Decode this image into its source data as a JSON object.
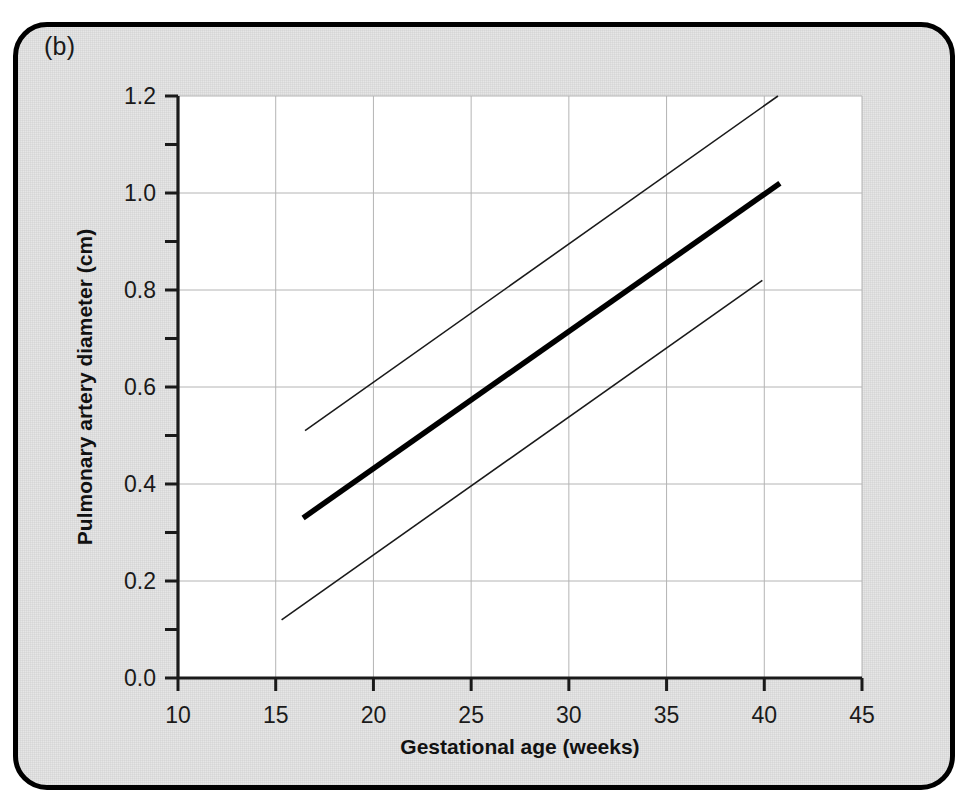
{
  "figure": {
    "panel_label": "(b)",
    "background_color": "#e6e6e6",
    "plot_background_color": "#ffffff",
    "frame_color": "#000000"
  },
  "chart_data": {
    "type": "line",
    "title": "",
    "subtitle": "",
    "xlabel": "Gestational age (weeks)",
    "ylabel": "Pulmonary artery diameter (cm)",
    "xlim": [
      10,
      45
    ],
    "ylim": [
      0.0,
      1.2
    ],
    "xticks": [
      10,
      15,
      20,
      25,
      30,
      35,
      40,
      45
    ],
    "xtick_labels": [
      "10",
      "15",
      "20",
      "25",
      "30",
      "35",
      "40",
      "45"
    ],
    "yticks": [
      0.0,
      0.2,
      0.4,
      0.6,
      0.8,
      1.0,
      1.2
    ],
    "ytick_labels": [
      "0.0",
      "0.2",
      "0.4",
      "0.6",
      "0.8",
      "1.0",
      "1.2"
    ],
    "y_minor_ticks": [
      0.1,
      0.3,
      0.5,
      0.7,
      0.9,
      1.1
    ],
    "grid": true,
    "grid_color": "#b4b4b4",
    "legend": "none",
    "legend_position": "none",
    "series": [
      {
        "name": "Upper reference limit",
        "style": "thin",
        "color": "#1a1a1a",
        "width": 1.6,
        "x": [
          16.5,
          40.7
        ],
        "values": [
          0.51,
          1.2
        ]
      },
      {
        "name": "Mean / 50th centile",
        "style": "bold",
        "color": "#000000",
        "width": 5.5,
        "x": [
          16.4,
          40.8
        ],
        "values": [
          0.33,
          1.02
        ]
      },
      {
        "name": "Lower reference limit",
        "style": "thin",
        "color": "#1a1a1a",
        "width": 1.6,
        "x": [
          15.3,
          39.9
        ],
        "values": [
          0.12,
          0.82
        ]
      }
    ]
  }
}
